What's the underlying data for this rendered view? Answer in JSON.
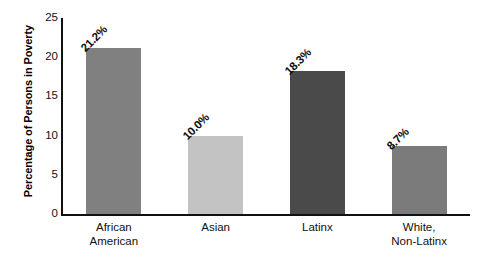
{
  "chart_data": {
    "type": "bar",
    "title": "",
    "subtitle": "",
    "xlabel": "",
    "ylabel": "Percentage of Persons in Poverty",
    "categories": [
      "African\nAmerican",
      "Asian",
      "Latinx",
      "White,\nNon-Latinx"
    ],
    "values": [
      21.2,
      10.0,
      18.3,
      8.7
    ],
    "data_labels": [
      "21.2%",
      "10.0%",
      "18.3%",
      "8.7%"
    ],
    "bar_colors": [
      "#808080",
      "#c3c3c3",
      "#4a4a4a",
      "#7b7b7b"
    ],
    "ylim": [
      0,
      25
    ],
    "yticks": [
      0,
      5,
      10,
      15,
      20,
      25
    ],
    "ytick_labels": [
      "0",
      "5",
      "10",
      "15",
      "20",
      "25"
    ],
    "grid": false,
    "legend": "none",
    "axis_color": "#111111",
    "background": "#ffffff"
  }
}
